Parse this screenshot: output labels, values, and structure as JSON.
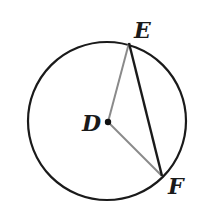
{
  "diagram": {
    "type": "circle-geometry",
    "circle": {
      "center_label": "D",
      "cx": 107,
      "cy": 121,
      "r": 79,
      "stroke": "#1a1a1a"
    },
    "points": {
      "D": {
        "label": "D",
        "x": 108,
        "y": 122
      },
      "E": {
        "label": "E",
        "x": 129,
        "y": 42
      },
      "F": {
        "label": "F",
        "x": 162,
        "y": 176
      }
    },
    "segments": [
      {
        "name": "radius-DE",
        "from": "D",
        "to": "E",
        "color": "#8a8a8a"
      },
      {
        "name": "radius-DF",
        "from": "D",
        "to": "F",
        "color": "#8a8a8a"
      },
      {
        "name": "chord-EF",
        "from": "E",
        "to": "F",
        "color": "#1a1a1a"
      }
    ],
    "labels": {
      "D": "D",
      "E": "E",
      "F": "F"
    }
  }
}
